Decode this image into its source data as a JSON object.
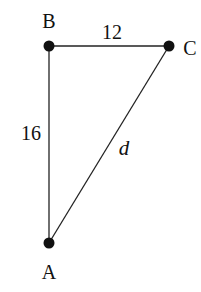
{
  "diagram": {
    "points": [
      {
        "id": "B",
        "label": "B",
        "x": 49,
        "y": 46,
        "lx": 49,
        "ly": 28
      },
      {
        "id": "C",
        "label": "C",
        "x": 169,
        "y": 46,
        "lx": 190,
        "ly": 55
      },
      {
        "id": "A",
        "label": "A",
        "x": 49,
        "y": 243,
        "lx": 49,
        "ly": 279
      }
    ],
    "edges": [
      {
        "from": "B",
        "to": "C",
        "label": "12",
        "lx": 112,
        "ly": 39,
        "italic": false
      },
      {
        "from": "B",
        "to": "A",
        "label": "16",
        "lx": 31,
        "ly": 140,
        "italic": false
      },
      {
        "from": "A",
        "to": "C",
        "label": "d",
        "lx": 124,
        "ly": 155,
        "italic": true
      }
    ],
    "colors": {
      "line": "#222222",
      "point": "#111111",
      "background": "#ffffff"
    }
  }
}
